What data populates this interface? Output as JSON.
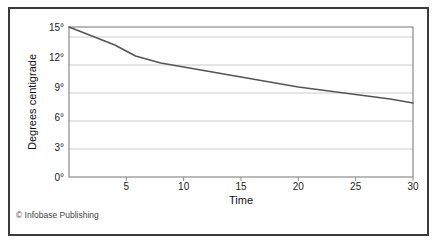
{
  "figure": {
    "credit": "© Infobase Publishing"
  },
  "chart_data": {
    "type": "line",
    "title": "",
    "xlabel": "Time",
    "ylabel": "Degrees centigrade",
    "xlim": [
      0,
      30
    ],
    "ylim": [
      0,
      15
    ],
    "grid": true,
    "legend": false,
    "xticks": [
      5,
      10,
      15,
      20,
      25,
      30
    ],
    "xticklabels": [
      "5",
      "10",
      "15",
      "20",
      "25",
      "30"
    ],
    "yticks": [
      0,
      3,
      6,
      9,
      12,
      15
    ],
    "yticklabels": [
      "0°",
      "3°",
      "6°",
      "9°",
      "12°",
      "15°"
    ],
    "series": [
      {
        "name": "Cooling curve",
        "color": "#555555",
        "x": [
          0,
          2,
          4,
          5.8,
          8,
          10,
          12,
          14,
          16,
          18,
          20,
          22,
          24,
          26,
          28,
          30
        ],
        "values": [
          15.0,
          14.1,
          13.2,
          12.1,
          11.4,
          11.0,
          10.6,
          10.2,
          9.8,
          9.4,
          9.0,
          8.7,
          8.4,
          8.1,
          7.8,
          7.4
        ]
      }
    ]
  }
}
